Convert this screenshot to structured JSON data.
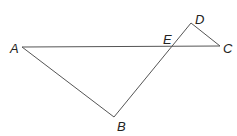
{
  "diagram": {
    "type": "geometry",
    "points": {
      "A": {
        "label": "A",
        "x": 22,
        "y": 47
      },
      "B": {
        "label": "B",
        "x": 114,
        "y": 117
      },
      "C": {
        "label": "C",
        "x": 220,
        "y": 46
      },
      "D": {
        "label": "D",
        "x": 191,
        "y": 23
      },
      "E": {
        "label": "E",
        "x": 171,
        "y": 47
      }
    },
    "segments": [
      "AC",
      "AB",
      "BD",
      "DC"
    ],
    "colors": {
      "line": "#555555",
      "text": "#222222"
    }
  }
}
